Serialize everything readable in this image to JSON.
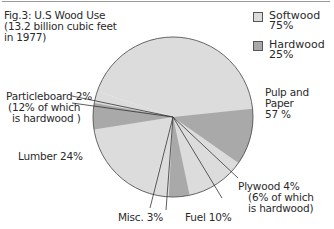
{
  "chart_data": {
    "type": "pie",
    "title": "Fig.3: U.S Wood Use",
    "subtitle": "(13.2 billion cubic feet in 1977)",
    "total_billion_cubic_feet": 13.2,
    "year": 1977,
    "categories": [
      "Pulp and Paper",
      "Plywood",
      "Fuel",
      "Misc.",
      "Lumber",
      "Particleboard"
    ],
    "values": [
      57,
      4,
      10,
      3,
      24,
      2
    ],
    "unit": "%",
    "legend": [
      {
        "name": "Softwood",
        "value": 75,
        "color": "#dcdcdc"
      },
      {
        "name": "Hardwood",
        "value": 25,
        "color": "#a9a9a9"
      }
    ],
    "annotations": {
      "Particleboard": "12% of which is hardwood",
      "Plywood": "6% of which is hardwood"
    },
    "legend_position": "top-right"
  },
  "title": {
    "line1": "Fig.3: U.S Wood Use",
    "line2": "(13.2 billion cubic feet",
    "line3": "in 1977)"
  },
  "legend": {
    "softwood_label": "Softwood",
    "softwood_value": "75%",
    "hardwood_label": "Hardwood",
    "hardwood_value": "25%"
  },
  "labels": {
    "particleboard_1": "Particleboard 2%",
    "particleboard_2": "(12% of which",
    "particleboard_3": "is hardwood )",
    "pulp_1": "Pulp and",
    "pulp_2": "Paper",
    "pulp_3": "57 %",
    "lumber": "Lumber 24%",
    "plywood_1": "Plywood  4%",
    "plywood_2": "(6% of which",
    "plywood_3": "is hardwood)",
    "misc": "Misc. 3%",
    "fuel": "Fuel 10%"
  },
  "colors": {
    "softwood": "#dcdcdc",
    "hardwood": "#a9a9a9",
    "outline": "#555555"
  }
}
